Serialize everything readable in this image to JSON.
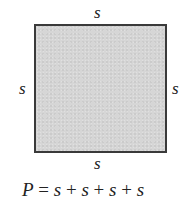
{
  "diagram": {
    "shape": "square",
    "fill_color": "#d6d6d6",
    "border_color": "#3a3a3a",
    "side_labels": {
      "top": "s",
      "bottom": "s",
      "left": "s",
      "right": "s"
    },
    "formula": {
      "lhs": "P",
      "equals": " = ",
      "terms": [
        "s",
        "s",
        "s",
        "s"
      ],
      "operator": " + ",
      "full_text": "P = s + s + s + s"
    }
  }
}
